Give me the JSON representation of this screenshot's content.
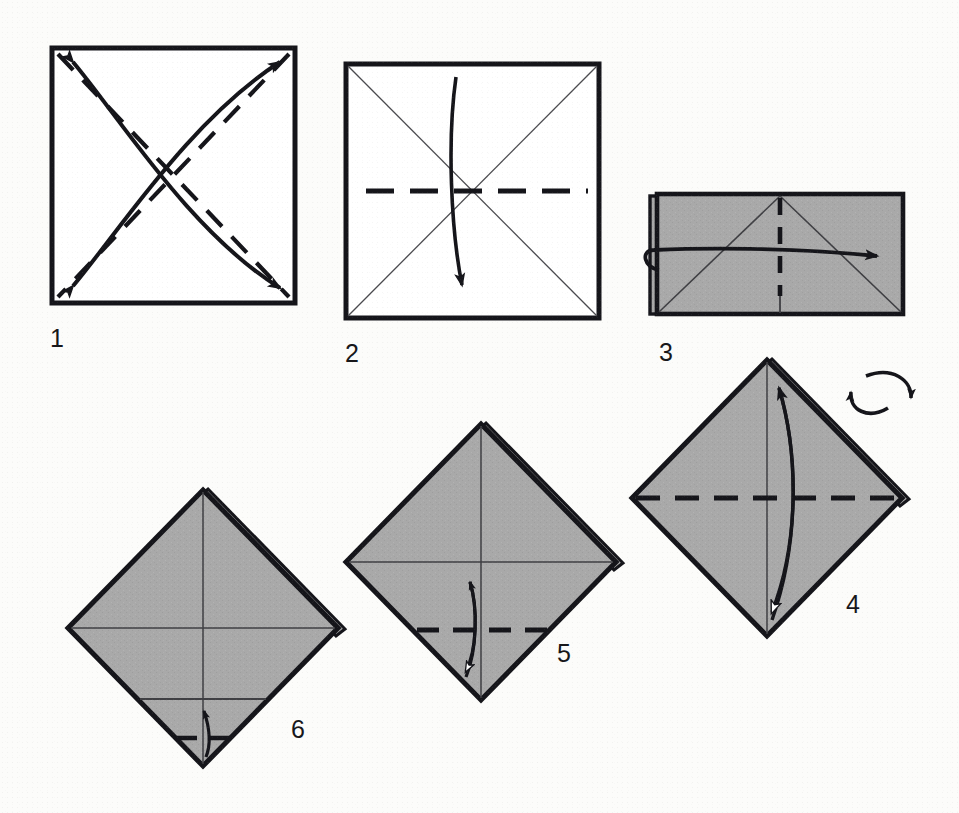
{
  "document": {
    "kind": "origami-folding-diagram",
    "title": "Origami folding sequence",
    "page_width": 959,
    "page_height": 813,
    "background_color": "#fcfcfa"
  },
  "palette": {
    "paper_front": "#ffffff",
    "paper_back_shaded": "#a9a9a9",
    "outline": "#15151a",
    "crease_thin": "#3a3a3e",
    "fold_dashed": "#15151a",
    "arrow": "#15151a",
    "arrow_hollow_fill": "#ffffff"
  },
  "steps": [
    {
      "number": "1",
      "label_x": 50,
      "label_y": 326,
      "shape": "square",
      "fill": "paper_front",
      "bounds": {
        "x": 50,
        "y": 46,
        "w": 247,
        "h": 259
      },
      "creases": [
        {
          "type": "dashed-fold",
          "from": "top-left",
          "to": "bottom-right"
        },
        {
          "type": "dashed-fold",
          "from": "top-right",
          "to": "bottom-left"
        }
      ],
      "arrows": [
        {
          "style": "curved-double-headed",
          "head_fill": "solid",
          "from": "bottom-right",
          "to": "top-left"
        },
        {
          "style": "curved-double-headed",
          "head_fill": "solid",
          "from": "bottom-left",
          "to": "top-right"
        }
      ],
      "instruction": "Fold and unfold both diagonals"
    },
    {
      "number": "2",
      "label_x": 345,
      "label_y": 341,
      "shape": "square",
      "fill": "paper_front",
      "bounds": {
        "x": 344,
        "y": 62,
        "w": 257,
        "h": 258
      },
      "creases": [
        {
          "type": "thin-crease",
          "from": "top-left",
          "to": "bottom-right"
        },
        {
          "type": "thin-crease",
          "from": "top-right",
          "to": "bottom-left"
        }
      ],
      "folds": [
        {
          "type": "dashed-fold",
          "orientation": "horizontal",
          "position": "center"
        }
      ],
      "arrows": [
        {
          "style": "curved-single",
          "head_fill": "solid",
          "direction": "down"
        }
      ],
      "instruction": "Fold top edge down to bottom edge"
    },
    {
      "number": "3",
      "label_x": 659,
      "label_y": 340,
      "shape": "rectangle",
      "fill": "paper_back_shaded",
      "bounds": {
        "x": 653,
        "y": 192,
        "w": 253,
        "h": 124
      },
      "creases": [
        {
          "type": "thin-crease",
          "from": "bottom-left",
          "to": "top-center"
        },
        {
          "type": "thin-crease",
          "from": "top-center",
          "to": "bottom-right"
        }
      ],
      "folds": [
        {
          "type": "dashed-fold",
          "orientation": "vertical",
          "position": "center"
        }
      ],
      "arrows": [
        {
          "style": "wrap-around",
          "head_fill": "solid",
          "direction": "right"
        }
      ],
      "instruction": "Fold the left half around to the right"
    },
    {
      "number": "4",
      "label_x": 846,
      "label_y": 592,
      "shape": "diamond",
      "fill": "paper_back_shaded",
      "bounds": {
        "x": 630,
        "y": 357,
        "w": 275,
        "h": 283
      },
      "creases": [
        {
          "type": "thin-crease",
          "orientation": "vertical",
          "position": "center"
        }
      ],
      "folds": [
        {
          "type": "dashed-fold",
          "orientation": "horizontal",
          "position": "center"
        }
      ],
      "arrows": [
        {
          "style": "curved-double-headed",
          "head_fill": "solid-up-hollow-down",
          "direction": "vertical"
        }
      ],
      "symbols": [
        {
          "name": "turn-over-icon",
          "x": 855,
          "y": 368,
          "w": 60,
          "h": 48
        }
      ],
      "instruction": "Fold bottom point up to top point and unfold; then turn the model over"
    },
    {
      "number": "5",
      "label_x": 557,
      "label_y": 641,
      "shape": "diamond",
      "fill": "paper_back_shaded",
      "bounds": {
        "x": 344,
        "y": 421,
        "w": 272,
        "h": 283
      },
      "creases": [
        {
          "type": "thin-crease",
          "orientation": "vertical",
          "position": "center"
        },
        {
          "type": "thin-crease",
          "orientation": "horizontal",
          "position": "center"
        }
      ],
      "folds": [
        {
          "type": "dashed-fold",
          "orientation": "horizontal",
          "position": "lower"
        }
      ],
      "arrows": [
        {
          "style": "curved-double-headed-short",
          "head_fill": "solid-up-hollow-down",
          "direction": "vertical"
        }
      ],
      "instruction": "Fold bottom point up to the centre and unfold"
    },
    {
      "number": "6",
      "label_x": 291,
      "label_y": 717,
      "shape": "diamond",
      "fill": "paper_back_shaded",
      "bounds": {
        "x": 66,
        "y": 487,
        "w": 272,
        "h": 283
      },
      "creases": [
        {
          "type": "thin-crease",
          "orientation": "vertical",
          "position": "center"
        },
        {
          "type": "thin-crease",
          "orientation": "horizontal",
          "position": "center"
        },
        {
          "type": "thin-crease",
          "orientation": "horizontal",
          "position": "lower"
        }
      ],
      "folds": [
        {
          "type": "dashed-fold",
          "orientation": "horizontal",
          "position": "bottom-short"
        }
      ],
      "arrows": [
        {
          "style": "small-curved",
          "head_fill": "solid",
          "direction": "up"
        }
      ],
      "instruction": "Fold the bottom point up a small amount"
    }
  ]
}
